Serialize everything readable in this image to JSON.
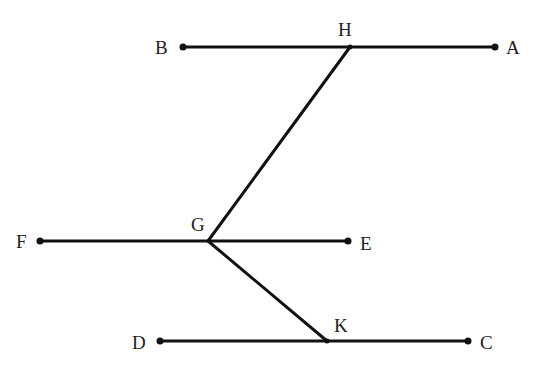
{
  "diagram": {
    "title": "",
    "points": {
      "A": {
        "label": "A",
        "x": 495,
        "y": 47
      },
      "B": {
        "label": "B",
        "x": 183,
        "y": 47
      },
      "H": {
        "label": "H",
        "x": 350,
        "y": 47
      },
      "E": {
        "label": "E",
        "x": 348,
        "y": 241
      },
      "F": {
        "label": "F",
        "x": 40,
        "y": 241
      },
      "G": {
        "label": "G",
        "x": 208,
        "y": 241
      },
      "C": {
        "label": "C",
        "x": 468,
        "y": 341
      },
      "D": {
        "label": "D",
        "x": 160,
        "y": 341
      },
      "K": {
        "label": "K",
        "x": 327,
        "y": 341
      }
    },
    "segments": [
      {
        "name": "AB",
        "from": "B",
        "to": "A"
      },
      {
        "name": "EF",
        "from": "F",
        "to": "E"
      },
      {
        "name": "CD",
        "from": "D",
        "to": "C"
      },
      {
        "name": "HG",
        "from": "H",
        "to": "G"
      },
      {
        "name": "GK",
        "from": "G",
        "to": "K"
      }
    ],
    "colors": {
      "line": "#111111",
      "label": "#222222",
      "background": "#ffffff"
    }
  }
}
